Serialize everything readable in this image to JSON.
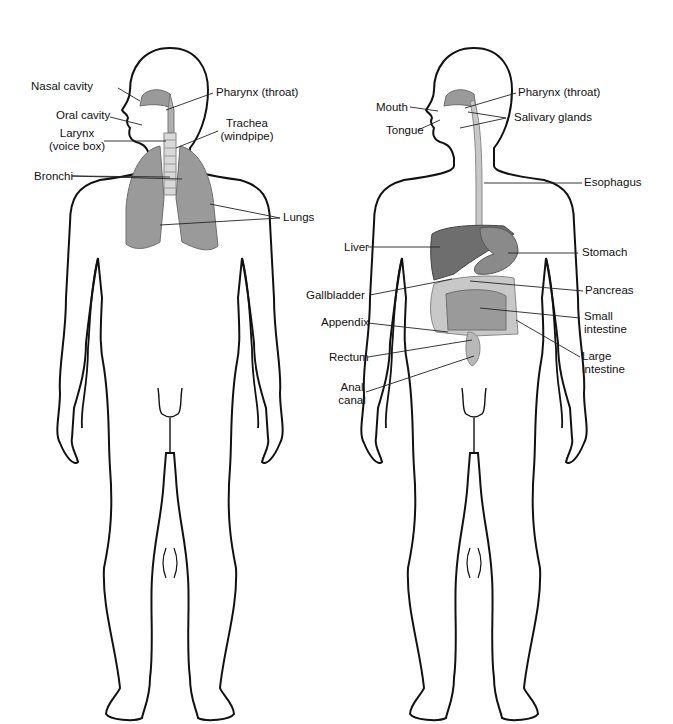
{
  "figures": [
    {
      "name": "respiratory-system",
      "labels": {
        "nasal_cavity": "Nasal cavity",
        "oral_cavity": "Oral cavity",
        "larynx_1": "Larynx",
        "larynx_2": "(voice box)",
        "bronchi": "Bronchi",
        "pharynx": "Pharynx (throat)",
        "trachea_1": "Trachea",
        "trachea_2": "(windpipe)",
        "lungs": "Lungs"
      }
    },
    {
      "name": "digestive-system",
      "labels": {
        "mouth": "Mouth",
        "tongue": "Tongue",
        "pharynx": "Pharynx (throat)",
        "salivary_glands": "Salivary glands",
        "esophagus": "Esophagus",
        "liver": "Liver",
        "stomach": "Stomach",
        "gallbladder": "Gallbladder",
        "pancreas": "Pancreas",
        "appendix": "Appendix",
        "small_intestine_1": "Small",
        "small_intestine_2": "intestine",
        "rectum": "Rectum",
        "large_intestine_1": "Large",
        "large_intestine_2": "intestine",
        "anal_canal_1": "Anal",
        "anal_canal_2": "canal"
      }
    }
  ],
  "colors": {
    "outline": "#111111",
    "organ": "#9a9a9a",
    "organ_dark": "#6e6e6e",
    "organ_light": "#c8c8c8"
  }
}
